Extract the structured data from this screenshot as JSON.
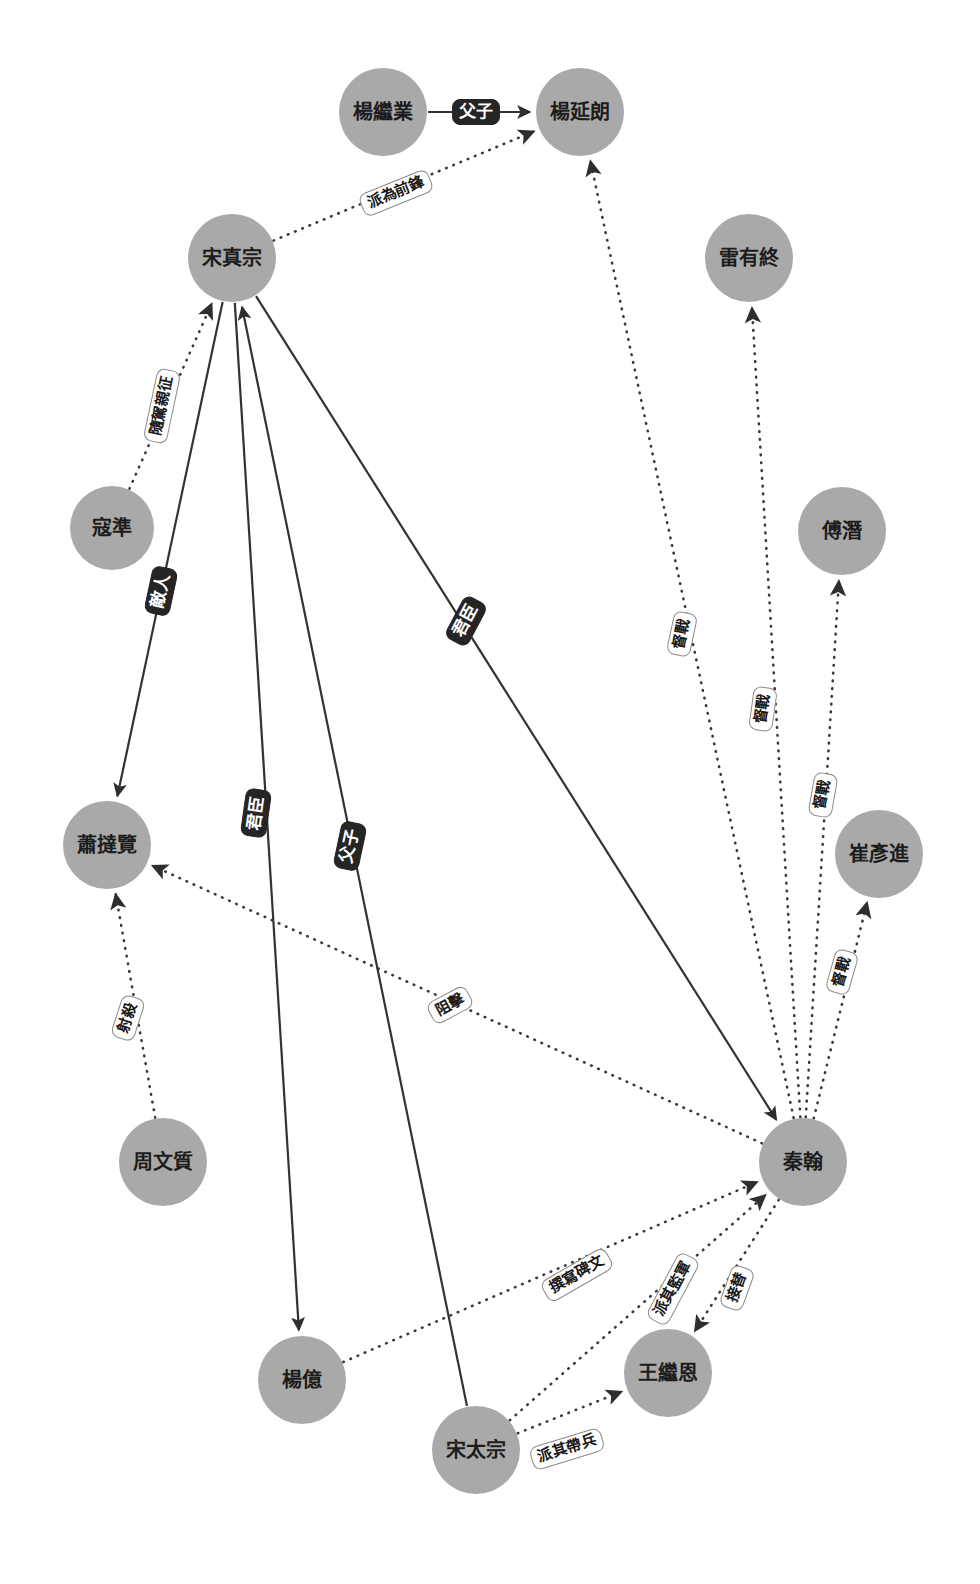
{
  "graph": {
    "type": "directed-knowledge-graph",
    "title": "",
    "background_color": "#ffffff",
    "node_color": "#a9a9a9",
    "node_text_color": "#1c1c1c",
    "solid_edge_color": "#333333",
    "dotted_edge_color": "#3a3a3a",
    "dark_label_bg": "#252525",
    "dark_label_text": "#ffffff",
    "light_label_bg": "#ffffff",
    "light_label_text": "#1a1a1a",
    "node_count": 13,
    "edge_count": 18
  },
  "nodes": [
    {
      "id": "yangjiye",
      "label": "楊繼業",
      "cx": 383,
      "cy": 112,
      "r": 44,
      "font_size": 20
    },
    {
      "id": "yangyanlang",
      "label": "楊延朗",
      "cx": 580,
      "cy": 112,
      "r": 44,
      "font_size": 20
    },
    {
      "id": "songzhenzong",
      "label": "宋真宗",
      "cx": 232,
      "cy": 258,
      "r": 44,
      "font_size": 20
    },
    {
      "id": "leiyouzhong",
      "label": "雷有終",
      "cx": 749,
      "cy": 258,
      "r": 44,
      "font_size": 20
    },
    {
      "id": "fuqian",
      "label": "傅潛",
      "cx": 842,
      "cy": 531,
      "r": 44,
      "font_size": 20
    },
    {
      "id": "kouzhun",
      "label": "寇準",
      "cx": 112,
      "cy": 528,
      "r": 42,
      "font_size": 20
    },
    {
      "id": "cuiyanjin",
      "label": "崔彥進",
      "cx": 879,
      "cy": 854,
      "r": 44,
      "font_size": 20
    },
    {
      "id": "xiaodalan",
      "label": "蕭撻覽",
      "cx": 107,
      "cy": 845,
      "r": 44,
      "font_size": 20
    },
    {
      "id": "zhouwenzhi",
      "label": "周文質",
      "cx": 163,
      "cy": 1162,
      "r": 44,
      "font_size": 20
    },
    {
      "id": "qinhan",
      "label": "秦翰",
      "cx": 803,
      "cy": 1162,
      "r": 44,
      "font_size": 20
    },
    {
      "id": "yangyi",
      "label": "楊億",
      "cx": 302,
      "cy": 1380,
      "r": 44,
      "font_size": 20
    },
    {
      "id": "wangjien",
      "label": "王繼恩",
      "cx": 668,
      "cy": 1373,
      "r": 44,
      "font_size": 20
    },
    {
      "id": "songtaizong",
      "label": "宋太宗",
      "cx": 476,
      "cy": 1450,
      "r": 44,
      "font_size": 20
    }
  ],
  "edges": [
    {
      "id": "e1",
      "source": "yangjiye",
      "target": "yangyanlang",
      "label": "父子",
      "style": "solid",
      "label_style": "dark",
      "lx": 476,
      "ly": 112,
      "rot": 0,
      "fs": 17
    },
    {
      "id": "e2",
      "source": "songzhenzong",
      "target": "yangyanlang",
      "label": "派為前鋒",
      "style": "dotted",
      "label_style": "light",
      "lx": 396,
      "ly": 193,
      "rot": -22,
      "fs": 15
    },
    {
      "id": "e3",
      "source": "kouzhun",
      "target": "songzhenzong",
      "label": "隨駕親征",
      "style": "dotted",
      "label_style": "light",
      "lx": 162,
      "ly": 406,
      "rot": -78,
      "fs": 15
    },
    {
      "id": "e4",
      "source": "songzhenzong",
      "target": "xiaodalan",
      "label": "敵人",
      "style": "solid",
      "label_style": "dark",
      "lx": 161,
      "ly": 591,
      "rot": -78,
      "fs": 17
    },
    {
      "id": "e5",
      "source": "songzhenzong",
      "target": "yangyi",
      "label": "君臣",
      "style": "solid",
      "label_style": "dark",
      "lx": 256,
      "ly": 813,
      "rot": -82,
      "fs": 17
    },
    {
      "id": "e6",
      "source": "songtaizong",
      "target": "songzhenzong",
      "label": "父子",
      "style": "solid",
      "label_style": "dark",
      "lx": 350,
      "ly": 846,
      "rot": -78,
      "fs": 17
    },
    {
      "id": "e7",
      "source": "songzhenzong",
      "target": "qinhan",
      "label": "君臣",
      "style": "solid",
      "label_style": "dark",
      "lx": 466,
      "ly": 621,
      "rot": -62,
      "fs": 17
    },
    {
      "id": "e8",
      "source": "qinhan",
      "target": "yangyanlang",
      "label": "督戰",
      "style": "dotted",
      "label_style": "light",
      "lx": 682,
      "ly": 634,
      "rot": -78,
      "fs": 15
    },
    {
      "id": "e9",
      "source": "qinhan",
      "target": "leiyouzhong",
      "label": "督戰",
      "style": "dotted",
      "label_style": "light",
      "lx": 763,
      "ly": 709,
      "rot": -82,
      "fs": 15
    },
    {
      "id": "e10",
      "source": "qinhan",
      "target": "fuqian",
      "label": "督戰",
      "style": "dotted",
      "label_style": "light",
      "lx": 823,
      "ly": 795,
      "rot": -80,
      "fs": 15
    },
    {
      "id": "e11",
      "source": "qinhan",
      "target": "cuiyanjin",
      "label": "督戰",
      "style": "dotted",
      "label_style": "light",
      "lx": 842,
      "ly": 972,
      "rot": -74,
      "fs": 15
    },
    {
      "id": "e12",
      "source": "qinhan",
      "target": "xiaodalan",
      "label": "阻擊",
      "style": "dotted",
      "label_style": "light",
      "lx": 450,
      "ly": 1005,
      "rot": -28,
      "fs": 15
    },
    {
      "id": "e13",
      "source": "zhouwenzhi",
      "target": "xiaodalan",
      "label": "射殺",
      "style": "dotted",
      "label_style": "light",
      "lx": 128,
      "ly": 1018,
      "rot": -72,
      "fs": 15
    },
    {
      "id": "e14",
      "source": "yangyi",
      "target": "qinhan",
      "label": "撰寫碑文",
      "style": "dotted",
      "label_style": "light",
      "lx": 577,
      "ly": 1275,
      "rot": -30,
      "fs": 15
    },
    {
      "id": "e15",
      "source": "songtaizong",
      "target": "qinhan",
      "label": "派其監軍",
      "style": "dotted",
      "label_style": "light",
      "lx": 673,
      "ly": 1289,
      "rot": -62,
      "fs": 15
    },
    {
      "id": "e16",
      "source": "qinhan",
      "target": "wangjien",
      "label": "接替",
      "style": "dotted",
      "label_style": "light",
      "lx": 737,
      "ly": 1288,
      "rot": -70,
      "fs": 15
    },
    {
      "id": "e17",
      "source": "songtaizong",
      "target": "wangjien",
      "label": "派其帶兵",
      "style": "dotted",
      "label_style": "light",
      "lx": 567,
      "ly": 1449,
      "rot": -17,
      "fs": 15
    }
  ]
}
